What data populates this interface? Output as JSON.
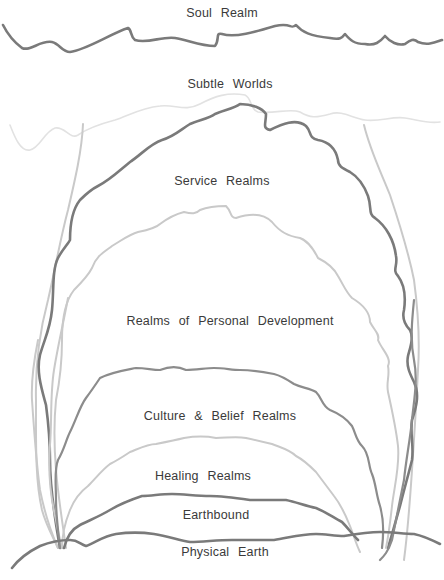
{
  "diagram": {
    "layers": [
      {
        "id": "soul",
        "label": "Soul Realm"
      },
      {
        "id": "subtle",
        "label": "Subtle Worlds"
      },
      {
        "id": "service",
        "label": "Service Realms"
      },
      {
        "id": "personal",
        "label": "Realms of Personal Development"
      },
      {
        "id": "culture",
        "label": "Culture & Belief Realms"
      },
      {
        "id": "healing",
        "label": "Healing Realms"
      },
      {
        "id": "earthbound",
        "label": "Earthbound"
      },
      {
        "id": "physical",
        "label": "Physical Earth"
      }
    ],
    "colors": {
      "text": "#3a3a3a",
      "dark_line": "#7a7a7a",
      "light_line": "#c9c9c9",
      "faint_line": "#e2e2e2",
      "background": "#ffffff"
    }
  }
}
